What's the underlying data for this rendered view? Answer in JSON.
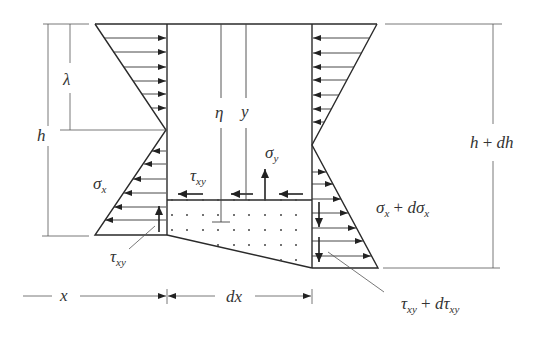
{
  "figure": {
    "line_color": "#2a2a2a",
    "background": "#ffffff",
    "labels": {
      "lambda": "λ",
      "h": "h",
      "eta": "η",
      "y": "y",
      "sigma_y": {
        "main": "σ",
        "sub": "y"
      },
      "tau_xy_top": {
        "main": "τ",
        "sub": "xy"
      },
      "sigma_x_left": {
        "main": "σ",
        "sub": "x"
      },
      "tau_xy_bottom": {
        "main": "τ",
        "sub": "xy"
      },
      "sigma_x_plus": {
        "main": "σ",
        "sub": "x",
        "op": " + ",
        "d": "dσ",
        "sub2": "x"
      },
      "h_plus_dh": {
        "a": "h",
        "op": " + ",
        "b": "dh"
      },
      "tau_xy_plus": {
        "main": "τ",
        "sub": "xy",
        "op": " + ",
        "d": "dτ",
        "sub2": "xy"
      },
      "x": "x",
      "dx": "dx"
    }
  }
}
